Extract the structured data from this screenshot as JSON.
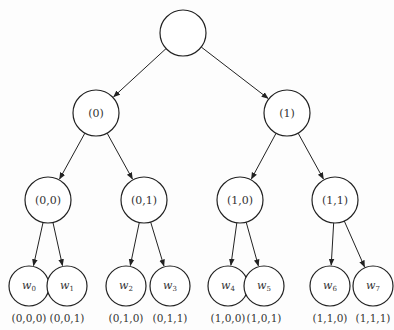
{
  "diagram": {
    "type": "binary-tree",
    "root": {
      "label": "",
      "x": 183,
      "y": 33,
      "r": 23
    },
    "level1": [
      {
        "label": "(0)",
        "x": 96,
        "y": 113,
        "r": 23
      },
      {
        "label": "(1)",
        "x": 287,
        "y": 113,
        "r": 23
      }
    ],
    "level2": [
      {
        "label": "(0,0)",
        "x": 48,
        "y": 200,
        "r": 23,
        "parent": 0
      },
      {
        "label": "(0,1)",
        "x": 144,
        "y": 200,
        "r": 23,
        "parent": 0
      },
      {
        "label": "(1,0)",
        "x": 240,
        "y": 200,
        "r": 23,
        "parent": 1
      },
      {
        "label": "(1,1)",
        "x": 335,
        "y": 200,
        "r": 23,
        "parent": 1
      }
    ],
    "leaves": [
      {
        "var": "w",
        "sub": "0",
        "code": "(0,0,0)",
        "x": 29,
        "y": 286,
        "r": 20,
        "parent": 0
      },
      {
        "var": "w",
        "sub": "1",
        "code": "(0,0,1)",
        "x": 67,
        "y": 286,
        "r": 20,
        "parent": 0
      },
      {
        "var": "w",
        "sub": "2",
        "code": "(0,1,0)",
        "x": 126,
        "y": 286,
        "r": 20,
        "parent": 1
      },
      {
        "var": "w",
        "sub": "3",
        "code": "(0,1,1)",
        "x": 170,
        "y": 286,
        "r": 20,
        "parent": 1
      },
      {
        "var": "w",
        "sub": "4",
        "code": "(1,0,0)",
        "x": 228,
        "y": 286,
        "r": 20,
        "parent": 2
      },
      {
        "var": "w",
        "sub": "5",
        "code": "(1,0,1)",
        "x": 264,
        "y": 286,
        "r": 20,
        "parent": 2
      },
      {
        "var": "w",
        "sub": "6",
        "code": "(1,1,0)",
        "x": 330,
        "y": 286,
        "r": 20,
        "parent": 3
      },
      {
        "var": "w",
        "sub": "7",
        "code": "(1,1,1)",
        "x": 373,
        "y": 286,
        "r": 20,
        "parent": 3
      }
    ]
  }
}
